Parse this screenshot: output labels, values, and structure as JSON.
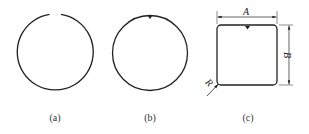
{
  "figure": {
    "panels": [
      {
        "id": "a",
        "caption": "(a)",
        "shape": "circle-with-gap"
      },
      {
        "id": "b",
        "caption": "(b)",
        "shape": "circle-with-top-mark"
      },
      {
        "id": "c",
        "caption": "(c)",
        "shape": "rounded-square-with-top-mark",
        "dimensions": {
          "width_label": "A",
          "height_label": "B",
          "radius_label": "R"
        }
      }
    ],
    "colors": {
      "stroke": "#222222",
      "background": "#ffffff"
    }
  }
}
